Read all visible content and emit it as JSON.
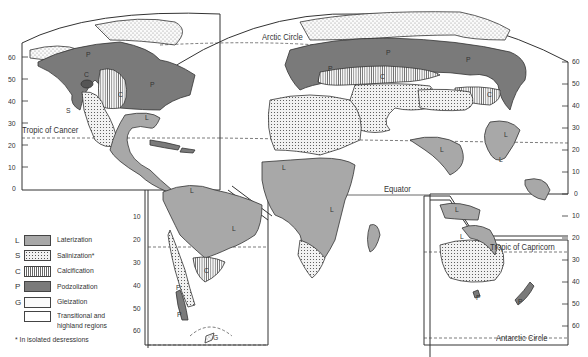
{
  "figure": {
    "map_labels": {
      "arctic_circle": "Arctic Circle",
      "tropic_of_cancer": "Tropic of Cancer",
      "equator": "Equator",
      "tropic_of_capricorn": "Tropic of Capricorn",
      "antarctic_circle": "Antarctic Circle"
    },
    "region_letters": {
      "L": "L",
      "S": "S",
      "C": "C",
      "P": "P",
      "G": "G"
    },
    "left_axis_ticks": [
      "60",
      "50",
      "40",
      "30",
      "20",
      "10",
      "0"
    ],
    "south_america_axis_ticks": [
      "10",
      "20",
      "30",
      "40",
      "50",
      "60"
    ],
    "right_axis_ticks": [
      "60",
      "50",
      "40",
      "30",
      "20",
      "10",
      "0",
      "10",
      "20",
      "30",
      "40",
      "50",
      "60"
    ]
  },
  "legend": {
    "items": [
      {
        "key": "L",
        "label": "Laterization",
        "pattern": "medium-gray"
      },
      {
        "key": "S",
        "label": "Salinization*",
        "pattern": "dense-dots"
      },
      {
        "key": "C",
        "label": "Calcification",
        "pattern": "vertical-lines"
      },
      {
        "key": "P",
        "label": "Podzolization",
        "pattern": "dark-gray"
      },
      {
        "key": "G",
        "label": "Gleization",
        "pattern": "sparse-dots"
      },
      {
        "key": "",
        "label": "Transitional and highland regions",
        "pattern": "white"
      }
    ],
    "note": "* In isolated desressions"
  },
  "colors": {
    "laterization": "#a8a8a8",
    "podzolization": "#7a7a7a",
    "outline": "#333333",
    "background": "#ffffff"
  }
}
